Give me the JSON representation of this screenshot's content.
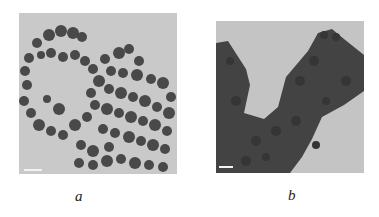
{
  "figure": {
    "panels": [
      {
        "id": "a",
        "caption": "a",
        "description": "TEM micrograph of discrete spherical nanoparticles forming ring-like chains",
        "background": "#c9c9c9",
        "particle_color": "#3a3a3a"
      },
      {
        "id": "b",
        "caption": "b",
        "description": "TEM micrograph of densely aggregated nanoparticle clusters",
        "background": "#c4c4c4",
        "particle_color": "#404040"
      }
    ]
  }
}
